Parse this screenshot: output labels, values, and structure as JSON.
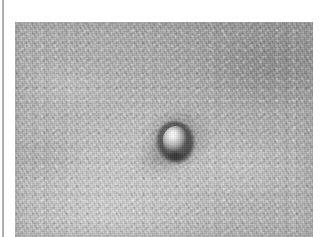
{
  "page": {
    "background_color": "#ffffff",
    "margin_rule": {
      "name": "left-margin-rule",
      "color": "#9a9a9a"
    }
  },
  "figure": {
    "kind": "clinical-photograph",
    "modality": "grayscale photograph",
    "caption": "",
    "label": "",
    "frame": {
      "x": 15,
      "y": 22,
      "width": 298,
      "height": 215
    },
    "colors": {
      "skin_mid": "#b0b0b0",
      "skin_light": "#cfcfcf",
      "skin_dark": "#8c8c8c",
      "lesion_highlight": "#f2f2f2",
      "lesion_shadow": "#3c3c3c"
    },
    "lesion": {
      "name": "central-nodule",
      "description": "dome-shaped papule with specular highlight and dark basal rim",
      "center_x": 161,
      "center_y": 119,
      "diameter_px": 28
    },
    "texture": {
      "skin_line_direction": "lower-left to upper-right",
      "grain": "fine photographic noise"
    }
  }
}
